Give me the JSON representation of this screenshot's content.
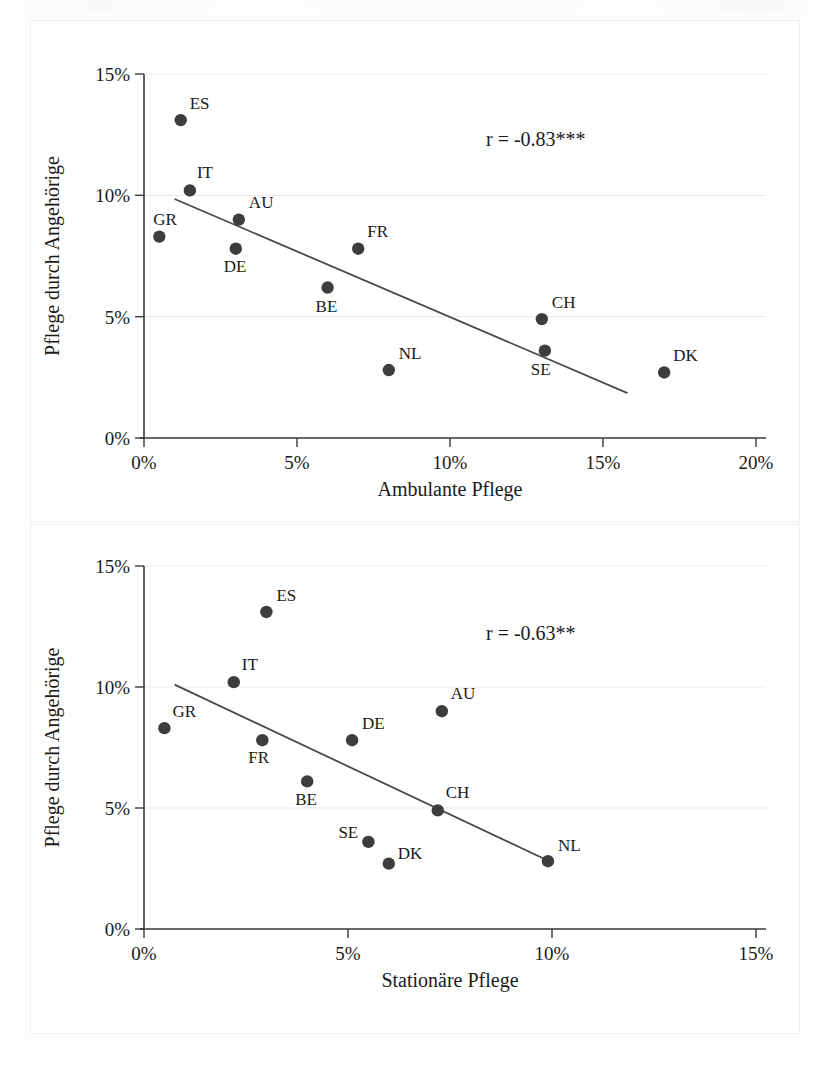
{
  "page": {
    "background_color": "#fdfdfd",
    "width": 820,
    "height": 1067
  },
  "style": {
    "dot_color": "#3d3d3d",
    "line_color": "#4a4a4a",
    "axis_color": "#3a3a3a",
    "grid_color": "#ebebeb"
  },
  "chart_data": [
    {
      "id": "chart-ambulante",
      "type": "scatter",
      "title": "",
      "xlabel": "Ambulante Pflege",
      "ylabel": "Pflege durch Angehörige",
      "xlim": [
        0,
        20
      ],
      "ylim": [
        0,
        15
      ],
      "xticks": [
        0,
        5,
        10,
        15,
        20
      ],
      "xticklabels": [
        "0%",
        "5%",
        "10%",
        "15%",
        "20%"
      ],
      "yticks": [
        0,
        5,
        10,
        15
      ],
      "yticklabels": [
        "0%",
        "5%",
        "10%",
        "15%"
      ],
      "grid": "horizontal",
      "annotation": "r = -0.83***",
      "points": [
        {
          "label": "GR",
          "x": 0.5,
          "y": 8.3,
          "label_dx": -6,
          "label_dy": -12
        },
        {
          "label": "ES",
          "x": 1.2,
          "y": 13.1,
          "label_dx": 9,
          "label_dy": -11
        },
        {
          "label": "IT",
          "x": 1.5,
          "y": 10.2,
          "label_dx": 7,
          "label_dy": -12
        },
        {
          "label": "DE",
          "x": 3.0,
          "y": 7.8,
          "label_dx": -12,
          "label_dy": 23
        },
        {
          "label": "AU",
          "x": 3.1,
          "y": 9.0,
          "label_dx": 10,
          "label_dy": -12
        },
        {
          "label": "BE",
          "x": 6.0,
          "y": 6.2,
          "label_dx": -12,
          "label_dy": 24
        },
        {
          "label": "FR",
          "x": 7.0,
          "y": 7.8,
          "label_dx": 9,
          "label_dy": -12
        },
        {
          "label": "NL",
          "x": 8.0,
          "y": 2.8,
          "label_dx": 10,
          "label_dy": -11
        },
        {
          "label": "CH",
          "x": 13.0,
          "y": 4.9,
          "label_dx": 10,
          "label_dy": -11
        },
        {
          "label": "SE",
          "x": 13.1,
          "y": 3.6,
          "label_dx": -14,
          "label_dy": 24
        },
        {
          "label": "DK",
          "x": 17.0,
          "y": 2.7,
          "label_dx": 9,
          "label_dy": -11
        }
      ],
      "fit_line": {
        "x0": 1.0,
        "y0": 9.85,
        "x1": 15.8,
        "y1": 1.85
      }
    },
    {
      "id": "chart-stationaere",
      "type": "scatter",
      "title": "",
      "xlabel": "Stationäre Pflege",
      "ylabel": "Pflege durch Angehörige",
      "xlim": [
        0,
        15
      ],
      "ylim": [
        0,
        15
      ],
      "xticks": [
        0,
        5,
        10,
        15
      ],
      "xticklabels": [
        "0%",
        "5%",
        "10%",
        "15%"
      ],
      "yticks": [
        0,
        5,
        10,
        15
      ],
      "yticklabels": [
        "0%",
        "5%",
        "10%",
        "15%"
      ],
      "grid": "horizontal",
      "annotation": "r = -0.63**",
      "points": [
        {
          "label": "GR",
          "x": 0.5,
          "y": 8.3,
          "label_dx": 8,
          "label_dy": -11
        },
        {
          "label": "IT",
          "x": 2.2,
          "y": 10.2,
          "label_dx": 8,
          "label_dy": -12
        },
        {
          "label": "ES",
          "x": 3.0,
          "y": 13.1,
          "label_dx": 10,
          "label_dy": -11
        },
        {
          "label": "FR",
          "x": 2.9,
          "y": 7.8,
          "label_dx": -14,
          "label_dy": 23
        },
        {
          "label": "BE",
          "x": 4.0,
          "y": 6.1,
          "label_dx": -12,
          "label_dy": 24
        },
        {
          "label": "DE",
          "x": 5.1,
          "y": 7.8,
          "label_dx": 10,
          "label_dy": -11
        },
        {
          "label": "SE",
          "x": 5.5,
          "y": 3.6,
          "label_dx": -30,
          "label_dy": -4
        },
        {
          "label": "DK",
          "x": 6.0,
          "y": 2.7,
          "label_dx": 9,
          "label_dy": -5
        },
        {
          "label": "AU",
          "x": 7.3,
          "y": 9.0,
          "label_dx": 9,
          "label_dy": -12
        },
        {
          "label": "CH",
          "x": 7.2,
          "y": 4.9,
          "label_dx": 8,
          "label_dy": -12
        },
        {
          "label": "NL",
          "x": 9.9,
          "y": 2.8,
          "label_dx": 10,
          "label_dy": -10
        }
      ],
      "fit_line": {
        "x0": 0.75,
        "y0": 10.1,
        "x1": 10.0,
        "y1": 2.75
      }
    }
  ]
}
